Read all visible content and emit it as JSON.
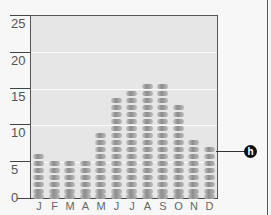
{
  "chart_data": {
    "type": "bar",
    "title": "",
    "xlabel": "",
    "ylabel": "",
    "categories": [
      "J",
      "F",
      "M",
      "A",
      "M",
      "J",
      "J",
      "A",
      "S",
      "O",
      "N",
      "D"
    ],
    "values": [
      7,
      6,
      6,
      6,
      10,
      15,
      16,
      17,
      17,
      14,
      9,
      8
    ],
    "ylim": [
      0,
      25
    ],
    "yticks": [
      0,
      5,
      10,
      15,
      20,
      25
    ],
    "grid": true,
    "legend": null,
    "annotations": [
      {
        "label": "h",
        "target": "D",
        "style": "black circle marker with leader line"
      }
    ]
  },
  "axis": {
    "yticks": [
      "0",
      "5",
      "10",
      "15",
      "20",
      "25"
    ],
    "xticks": [
      "J",
      "F",
      "M",
      "A",
      "M",
      "J",
      "J",
      "A",
      "S",
      "O",
      "N",
      "D"
    ]
  },
  "marker": {
    "label": "h"
  },
  "colors": {
    "plot_bg": "#e6e6e6",
    "pill": "#9a9a9a",
    "marker": "#111111"
  }
}
